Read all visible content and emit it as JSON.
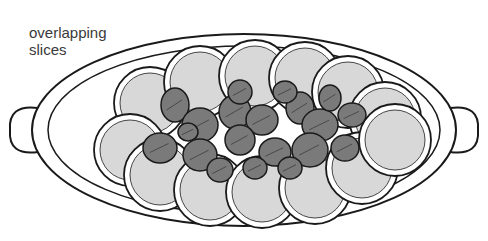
{
  "label": {
    "line1": "overlapping",
    "line2": "slices"
  },
  "colors": {
    "ink": "#1a1a1a",
    "slice_fill": "#d8d8d8",
    "leaf_fill": "#7a7a7a",
    "plate": "#ffffff"
  },
  "plate": {
    "cx": 244,
    "cy": 130,
    "rx": 212,
    "ry": 96
  },
  "slices_top": [
    [
      150,
      103
    ],
    [
      200,
      82
    ],
    [
      255,
      76
    ],
    [
      305,
      78
    ],
    [
      348,
      92
    ],
    [
      385,
      118
    ]
  ],
  "slices_bottom": [
    [
      130,
      150
    ],
    [
      160,
      175
    ],
    [
      210,
      190
    ],
    [
      262,
      192
    ],
    [
      315,
      188
    ],
    [
      362,
      168
    ],
    [
      395,
      140
    ]
  ],
  "leaves": [
    [
      175,
      105,
      14,
      17
    ],
    [
      200,
      125,
      18,
      17
    ],
    [
      235,
      112,
      16,
      17
    ],
    [
      262,
      120,
      16,
      15
    ],
    [
      300,
      108,
      14,
      16
    ],
    [
      320,
      125,
      18,
      16
    ],
    [
      352,
      115,
      14,
      12
    ],
    [
      160,
      148,
      17,
      15
    ],
    [
      200,
      155,
      17,
      16
    ],
    [
      240,
      140,
      15,
      15
    ],
    [
      275,
      152,
      16,
      14
    ],
    [
      310,
      150,
      18,
      17
    ],
    [
      345,
      148,
      14,
      13
    ],
    [
      220,
      170,
      13,
      12
    ],
    [
      255,
      168,
      12,
      11
    ],
    [
      290,
      168,
      12,
      11
    ],
    [
      188,
      132,
      10,
      9
    ],
    [
      330,
      98,
      11,
      13
    ],
    [
      240,
      92,
      12,
      12
    ],
    [
      285,
      92,
      12,
      11
    ]
  ]
}
